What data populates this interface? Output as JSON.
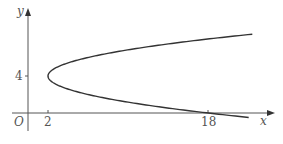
{
  "chart_data": {
    "type": "line",
    "title": "",
    "xlabel": "x",
    "ylabel": "y",
    "origin_label": "O",
    "curve": "x = (y - 4)^2 + 2",
    "vertex": [
      2,
      4
    ],
    "x_ticks": [
      {
        "value": 2,
        "label": "2"
      },
      {
        "value": 18,
        "label": "18"
      }
    ],
    "y_ticks": [
      {
        "value": 4,
        "label": "4"
      }
    ],
    "xlim": [
      -1.6,
      25.5
    ],
    "ylim": [
      -2,
      11
    ],
    "grid": false,
    "legend": null,
    "series": [
      {
        "name": "curve",
        "points": [
          [
            22.4,
            8.52
          ],
          [
            18,
            8
          ],
          [
            11,
            7
          ],
          [
            6,
            6
          ],
          [
            3,
            5
          ],
          [
            2,
            4
          ],
          [
            3,
            3
          ],
          [
            6,
            2
          ],
          [
            11,
            1
          ],
          [
            18,
            0
          ],
          [
            22.4,
            -0.52
          ]
        ]
      }
    ],
    "colors": {
      "axis": "#555555",
      "curve": "#333333"
    }
  }
}
